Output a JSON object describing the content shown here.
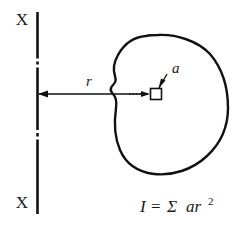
{
  "figure": {
    "background_color": "#ffffff",
    "line_color": "#111111",
    "labels": {
      "axis_top": "X",
      "axis_bottom": "X",
      "radius": "r",
      "area_element": "a"
    },
    "formula": {
      "lhs": "I",
      "equals": "=",
      "sigma": "Σ",
      "term_base": "ar",
      "term_exponent": "2",
      "full_text": "I = Σ ar²"
    },
    "elements": {
      "axis_line_name": "centerline X-X",
      "dimension_line_name": "radius dimension r",
      "shape_name": "irregular cross-section outline",
      "element_square_name": "elemental area a"
    }
  }
}
